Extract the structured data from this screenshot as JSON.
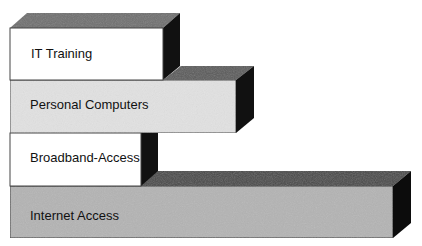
{
  "diagram": {
    "type": "stacked-3d-bars",
    "bars": [
      {
        "label": "IT Training",
        "fill": "#ffffff",
        "top_fill": "#6f6f6f",
        "side_fill": "#111111"
      },
      {
        "label": "Personal Computers",
        "fill": "#e2e2e2",
        "top_fill": "#5c5c5c",
        "side_fill": "#111111"
      },
      {
        "label": "Broadband-Access",
        "fill": "#ffffff",
        "top_fill": "#555555",
        "side_fill": "#111111"
      },
      {
        "label": "Internet Access",
        "fill": "#b4b4b4",
        "top_fill": "#4a4a4a",
        "side_fill": "#0c0c0c"
      }
    ]
  }
}
